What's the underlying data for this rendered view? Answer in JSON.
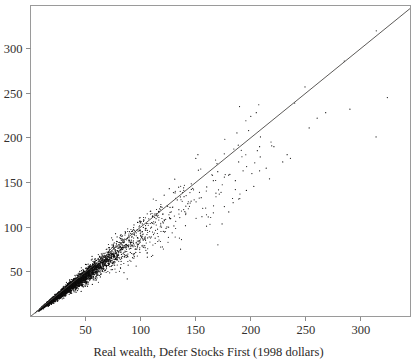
{
  "chart_data": {
    "type": "scatter",
    "title": "",
    "subtitle": "",
    "xlabel": "Real wealth, Defer Stocks First (1998 dollars)",
    "ylabel": "",
    "xlim": [
      0,
      345
    ],
    "ylim": [
      0,
      348
    ],
    "xticks": [
      50,
      100,
      150,
      200,
      250,
      300
    ],
    "yticks": [
      50,
      100,
      150,
      200,
      250,
      300
    ],
    "xtick_labels": [
      "50",
      "100",
      "150",
      "200",
      "250",
      "300"
    ],
    "ytick_labels": [
      "50",
      "100",
      "150",
      "200",
      "250",
      "300"
    ],
    "grid": false,
    "legend": null,
    "legend_position": "none",
    "point_color": "#0d0c0c",
    "point_size": 1.0,
    "n_points": 3400,
    "annotations": [
      {
        "type": "line",
        "name": "45-degree-identity-line",
        "from": [
          0,
          0
        ],
        "to": [
          345,
          345
        ],
        "color": "#4a4745",
        "label": ""
      }
    ],
    "series": [
      {
        "name": "Real wealth comparison",
        "color": "#0d0c0c",
        "cloud": {
          "x_distribution": "lognormal-like, heavy mass below 100",
          "x_median": 52,
          "x_p90": 135,
          "x_max": 325,
          "ratio_mean": 0.93,
          "ratio_sd_base": 0.055,
          "ratio_sd_growth": 0.00055,
          "below_line_bias": true
        }
      }
    ],
    "sparse_outliers": [
      [
        205,
        228
      ],
      [
        200,
        224
      ],
      [
        219,
        191
      ],
      [
        221,
        190
      ],
      [
        208,
        190
      ],
      [
        233,
        181
      ],
      [
        236,
        177
      ],
      [
        229,
        173
      ],
      [
        198,
        208
      ],
      [
        253,
        211
      ],
      [
        290,
        232
      ],
      [
        324,
        245
      ],
      [
        268,
        228
      ],
      [
        217,
        154
      ],
      [
        214,
        166
      ],
      [
        208,
        163
      ],
      [
        201,
        160
      ],
      [
        189,
        173
      ],
      [
        193,
        163
      ],
      [
        186,
        152
      ],
      [
        181,
        159
      ],
      [
        176,
        156
      ],
      [
        170,
        162
      ],
      [
        166,
        152
      ],
      [
        160,
        145
      ],
      [
        152,
        181
      ],
      [
        173,
        139
      ],
      [
        190,
        132
      ],
      [
        196,
        141
      ],
      [
        186,
        142
      ],
      [
        180,
        117
      ],
      [
        176,
        123
      ],
      [
        166,
        116
      ],
      [
        155,
        133
      ],
      [
        145,
        127
      ],
      [
        139,
        144
      ],
      [
        126,
        143
      ],
      [
        120,
        106
      ],
      [
        114,
        113
      ],
      [
        109,
        99
      ]
    ]
  },
  "axes": {
    "frame_color": "#9a9a9a",
    "tick_color": "#8d8d8d",
    "background": "#ffffff"
  }
}
